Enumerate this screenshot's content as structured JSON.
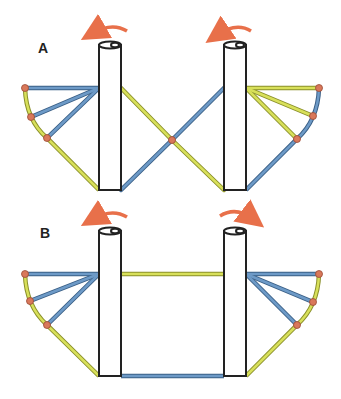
{
  "panels": [
    {
      "label": "A",
      "left_rotation": "counterclockwise",
      "right_rotation": "counterclockwise"
    },
    {
      "label": "B",
      "left_rotation": "counterclockwise",
      "right_rotation": "clockwise"
    }
  ],
  "colors": {
    "blue_bar": "#5b87b5",
    "yellow_bar": "#c9d44f",
    "arrow": "#e8704a",
    "node": "#d9785a",
    "pillar_stroke": "#222222"
  }
}
